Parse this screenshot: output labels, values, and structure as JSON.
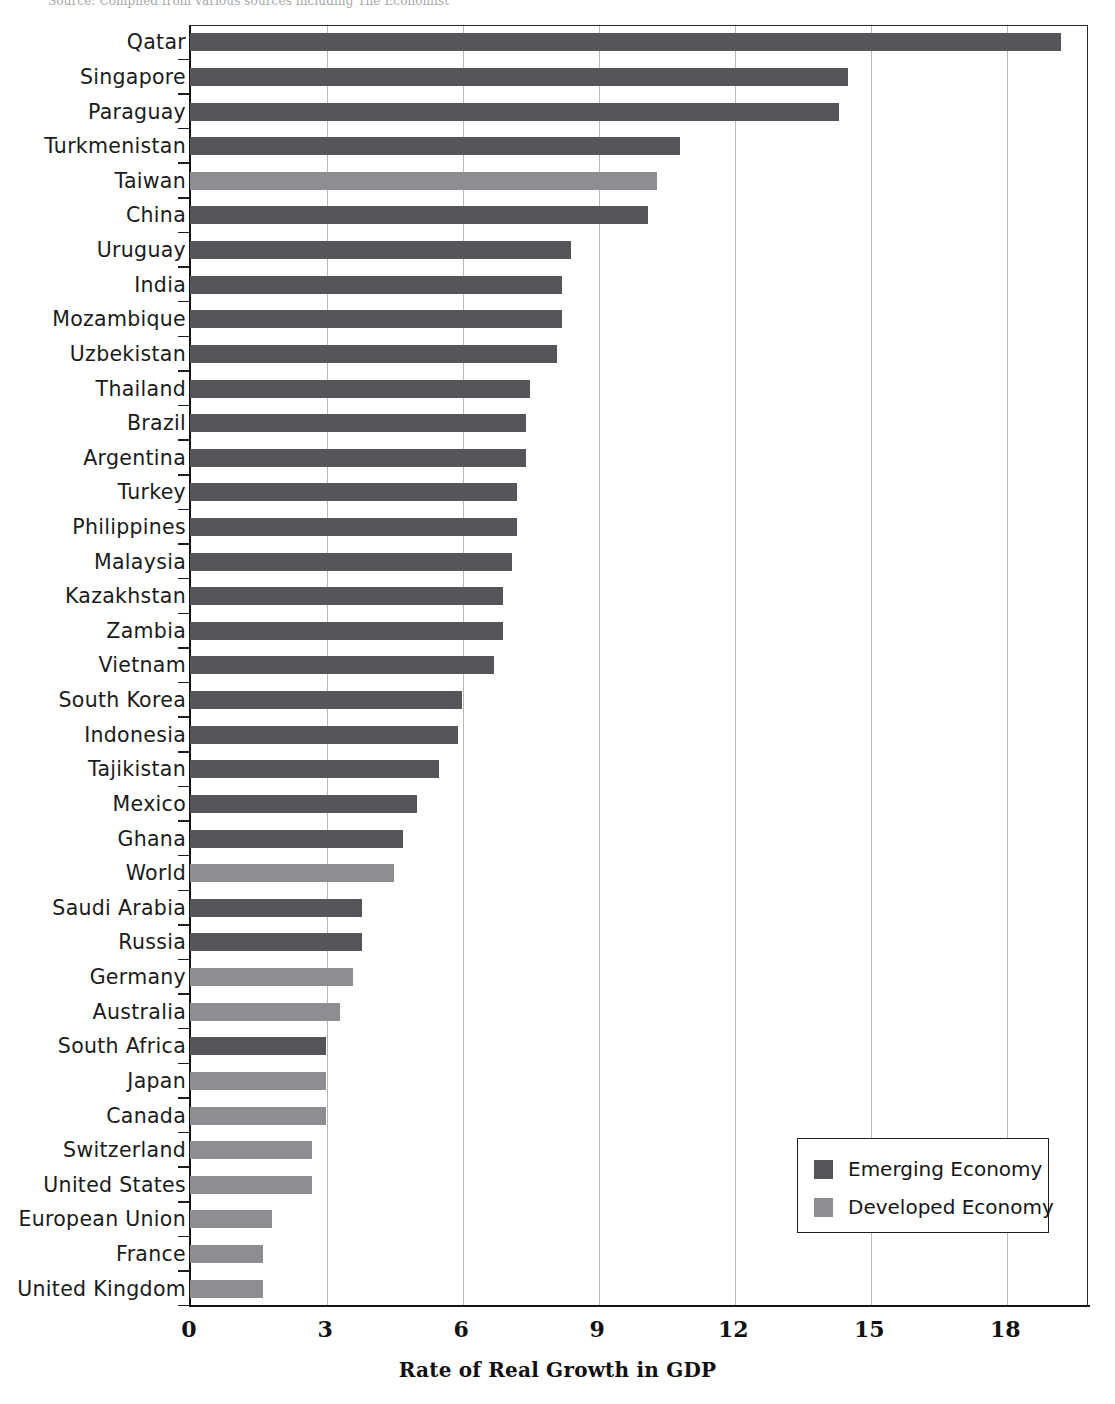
{
  "source_note": "Source: Compiled from various sources including The Economist",
  "colors": {
    "emerging": "#55555a",
    "developed": "#8d8d92",
    "gridline": "#b9b9b9",
    "axis": "#151515"
  },
  "legend": {
    "items": [
      {
        "label": "Emerging Economy",
        "series": "emerging"
      },
      {
        "label": "Developed Economy",
        "series": "developed"
      }
    ]
  },
  "chart_data": {
    "type": "bar",
    "orientation": "horizontal",
    "title": "",
    "xlabel": "Rate of Real Growth in GDP",
    "ylabel": "",
    "xlim": [
      0,
      19.8
    ],
    "xticks": [
      0,
      3,
      6,
      9,
      12,
      15,
      18
    ],
    "grid": true,
    "legend_position": "bottom-right",
    "series": [
      {
        "name": "Emerging Economy",
        "color": "#55555a"
      },
      {
        "name": "Developed Economy",
        "color": "#8d8d92"
      }
    ],
    "categories": [
      "Qatar",
      "Singapore",
      "Paraguay",
      "Turkmenistan",
      "Taiwan",
      "China",
      "Uruguay",
      "India",
      "Mozambique",
      "Uzbekistan",
      "Thailand",
      "Brazil",
      "Argentina",
      "Turkey",
      "Philippines",
      "Malaysia",
      "Kazakhstan",
      "Zambia",
      "Vietnam",
      "South Korea",
      "Indonesia",
      "Tajikistan",
      "Mexico",
      "Ghana",
      "World",
      "Saudi Arabia",
      "Russia",
      "Germany",
      "Australia",
      "South Africa",
      "Japan",
      "Canada",
      "Switzerland",
      "United States",
      "European Union",
      "France",
      "United Kingdom"
    ],
    "values": [
      19.2,
      14.5,
      14.3,
      10.8,
      10.3,
      10.1,
      8.4,
      8.2,
      8.2,
      8.1,
      7.5,
      7.4,
      7.4,
      7.2,
      7.2,
      7.1,
      6.9,
      6.9,
      6.7,
      6.0,
      5.9,
      5.5,
      5.0,
      4.7,
      4.5,
      3.8,
      3.8,
      3.6,
      3.3,
      3.0,
      3.0,
      3.0,
      2.7,
      2.7,
      1.8,
      1.6,
      1.6
    ],
    "groups": [
      "emerging",
      "emerging",
      "emerging",
      "emerging",
      "developed",
      "emerging",
      "emerging",
      "emerging",
      "emerging",
      "emerging",
      "emerging",
      "emerging",
      "emerging",
      "emerging",
      "emerging",
      "emerging",
      "emerging",
      "emerging",
      "emerging",
      "emerging",
      "emerging",
      "emerging",
      "emerging",
      "emerging",
      "developed",
      "emerging",
      "emerging",
      "developed",
      "developed",
      "emerging",
      "developed",
      "developed",
      "developed",
      "developed",
      "developed",
      "developed",
      "developed"
    ]
  }
}
